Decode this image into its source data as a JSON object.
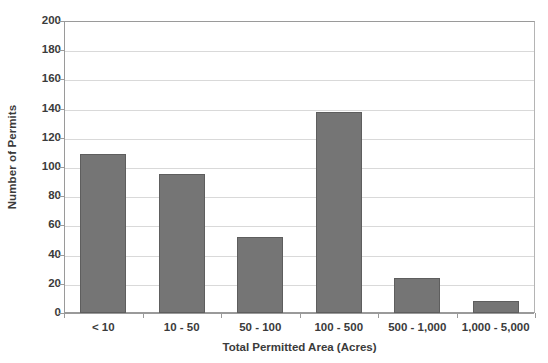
{
  "chart_data": {
    "type": "bar",
    "title": "",
    "categories": [
      "< 10",
      "10 - 50",
      "50 - 100",
      "100 - 500",
      "500 - 1,000",
      "1,000 - 5,000"
    ],
    "values": [
      109,
      95,
      52,
      138,
      24,
      8
    ],
    "xlabel": "Total Permitted Area (Acres)",
    "ylabel": "Number of Permits",
    "ylim": [
      0,
      200
    ],
    "ytick_step": 20,
    "yticks": [
      0,
      20,
      40,
      60,
      80,
      100,
      120,
      140,
      160,
      180,
      200
    ],
    "ytick_labels": [
      "0",
      "20",
      "40",
      "60",
      "80",
      "100",
      "120",
      "140",
      "160",
      "180",
      "200"
    ],
    "grid": true,
    "grid_axis": "y",
    "legend": false,
    "legend_position": "none",
    "bar_color": "#757575",
    "bar_edge_color": "#5e5e5e",
    "grid_color": "#d9d9d9",
    "axis_color": "#9a9a9a",
    "text_color": "#3b3b3b",
    "background": "#ffffff"
  }
}
